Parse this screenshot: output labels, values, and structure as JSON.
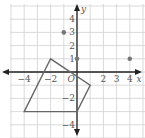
{
  "chart_data": {
    "type": "scatter",
    "title": "",
    "xlabel": "x",
    "ylabel": "y",
    "origin_label": "O",
    "xlim": [
      -5,
      5
    ],
    "ylim": [
      -5,
      5
    ],
    "grid": true,
    "x_tick_labels": [
      "−4",
      "−2",
      "2",
      "3",
      "4"
    ],
    "x_tick_values": [
      -4,
      -2,
      2,
      3,
      4
    ],
    "y_tick_labels": [
      "4",
      "3",
      "2",
      "1",
      "−2",
      "−4"
    ],
    "y_tick_values": [
      4,
      3,
      2,
      1,
      -2,
      -4
    ],
    "points": [
      {
        "x": -1,
        "y": 3
      },
      {
        "x": 0,
        "y": 1
      },
      {
        "x": 4,
        "y": 1
      }
    ],
    "polygon": {
      "vertices": [
        [
          -4,
          -3
        ],
        [
          -2,
          1
        ],
        [
          1,
          -1
        ],
        [
          0,
          -3
        ]
      ]
    },
    "colors": {
      "grid": "#d0d0d0",
      "axis": "#222222",
      "polygon": "#666666",
      "points": "#777777"
    }
  }
}
